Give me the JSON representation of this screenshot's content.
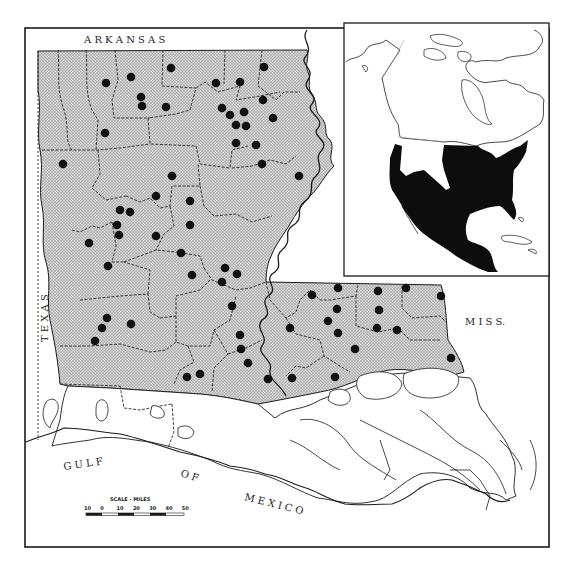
{
  "map": {
    "title": "Louisiana distribution map with North America range inset",
    "colors": {
      "background": "#ffffff",
      "ink": "#1a1a1a",
      "range_fill": "#c8c8c8",
      "range_pattern_dot": "#8a8a8a",
      "record_dot": "#111111",
      "inset_range": "#0d0d0d"
    },
    "labels": {
      "north": "A R K A N S A S",
      "west": "T E X A S",
      "east": "M I S S.",
      "gulf_1": "G U L F",
      "gulf_2": "O F",
      "gulf_3": "M E X I C O"
    },
    "scale": {
      "title": "SCALE - MILES",
      "ticks": [
        "10",
        "0",
        "10",
        "20",
        "30",
        "40",
        "50"
      ]
    },
    "inset": {
      "label": "North America range inset",
      "range_description": "Eastern and central United States, southward through Mexico"
    },
    "record_points": [
      [
        106,
        83
      ],
      [
        131,
        77
      ],
      [
        171,
        68
      ],
      [
        141,
        97
      ],
      [
        142,
        106
      ],
      [
        166,
        107
      ],
      [
        105,
        133
      ],
      [
        216,
        83
      ],
      [
        240,
        82
      ],
      [
        264,
        67
      ],
      [
        263,
        100
      ],
      [
        222,
        108
      ],
      [
        230,
        115
      ],
      [
        244,
        112
      ],
      [
        236,
        125
      ],
      [
        246,
        126
      ],
      [
        236,
        143
      ],
      [
        273,
        118
      ],
      [
        256,
        145
      ],
      [
        262,
        164
      ],
      [
        299,
        176
      ],
      [
        63,
        164
      ],
      [
        172,
        176
      ],
      [
        156,
        196
      ],
      [
        190,
        201
      ],
      [
        120,
        210
      ],
      [
        130,
        212
      ],
      [
        117,
        225
      ],
      [
        119,
        235
      ],
      [
        190,
        225
      ],
      [
        89,
        243
      ],
      [
        156,
        236
      ],
      [
        108,
        266
      ],
      [
        181,
        253
      ],
      [
        192,
        275
      ],
      [
        225,
        268
      ],
      [
        237,
        274
      ],
      [
        222,
        282
      ],
      [
        232,
        306
      ],
      [
        107,
        318
      ],
      [
        131,
        324
      ],
      [
        102,
        328
      ],
      [
        95,
        341
      ],
      [
        240,
        335
      ],
      [
        241,
        349
      ],
      [
        248,
        363
      ],
      [
        187,
        377
      ],
      [
        200,
        374
      ],
      [
        290,
        328
      ],
      [
        268,
        379
      ],
      [
        292,
        378
      ],
      [
        312,
        295
      ],
      [
        338,
        288
      ],
      [
        378,
        291
      ],
      [
        406,
        288
      ],
      [
        441,
        296
      ],
      [
        337,
        309
      ],
      [
        379,
        310
      ],
      [
        328,
        321
      ],
      [
        338,
        333
      ],
      [
        377,
        328
      ],
      [
        397,
        330
      ],
      [
        355,
        349
      ],
      [
        451,
        358
      ],
      [
        335,
        377
      ]
    ]
  }
}
